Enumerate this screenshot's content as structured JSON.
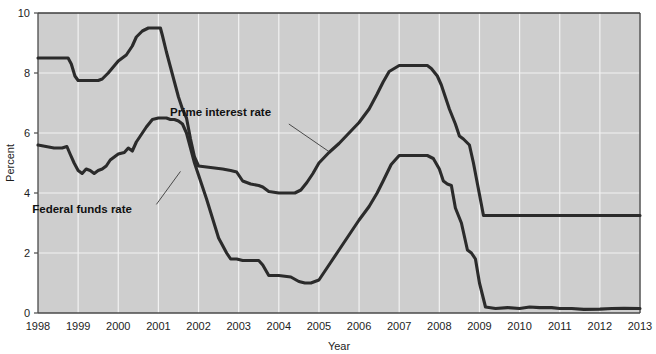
{
  "chart_data": {
    "type": "line",
    "title": "",
    "subtitle": "",
    "xlabel": "Year",
    "ylabel": "Percent",
    "xlim": [
      1998,
      2013
    ],
    "ylim": [
      0,
      10
    ],
    "grid": true,
    "legend_position": "inline-annotations",
    "plot_background": "#cecece",
    "line_color": "#2b2b2b",
    "gridline_color": "#f2f2f2",
    "frame_color": "#3c3c3c",
    "xticks": [
      1998,
      1999,
      2000,
      2001,
      2002,
      2003,
      2004,
      2005,
      2006,
      2007,
      2008,
      2009,
      2010,
      2011,
      2012,
      2013
    ],
    "xtick_labels": [
      "1998",
      "1999",
      "2000",
      "2001",
      "2002",
      "2003",
      "2004",
      "2005",
      "2006",
      "2007",
      "2008",
      "2009",
      "2010",
      "2011",
      "2012",
      "2013"
    ],
    "yticks": [
      0,
      2,
      4,
      6,
      8,
      10
    ],
    "ytick_labels": [
      "0",
      "2",
      "4",
      "6",
      "8",
      "10"
    ],
    "annotations": [
      {
        "name": "prime-interest-rate-annotation",
        "text": "Prime interest rate",
        "text_x": 2002.55,
        "text_y": 6.58,
        "leader_from_x": 2004.25,
        "leader_from_y": 6.3,
        "leader_to_x": 2005.25,
        "leader_to_y": 5.38
      },
      {
        "name": "federal-funds-rate-annotation",
        "text": "Federal funds rate",
        "text_x": 1999.1,
        "text_y": 3.32,
        "leader_from_x": 2000.95,
        "leader_from_y": 3.62,
        "leader_to_x": 2001.55,
        "leader_to_y": 4.72
      }
    ],
    "series": [
      {
        "name": "Prime interest rate",
        "color": "#2b2b2b",
        "x": [
          1998.0,
          1998.75,
          1998.83,
          1998.92,
          1999.0,
          1999.5,
          1999.6,
          1999.75,
          2000.0,
          2000.1,
          2000.2,
          2000.35,
          2000.45,
          2000.6,
          2000.75,
          2001.0,
          2001.05,
          2001.1,
          2001.2,
          2001.3,
          2001.4,
          2001.5,
          2001.6,
          2001.7,
          2001.8,
          2001.9,
          2002.0,
          2002.3,
          2002.6,
          2002.8,
          2002.95,
          2003.1,
          2003.3,
          2003.5,
          2003.6,
          2003.75,
          2004.0,
          2004.4,
          2004.55,
          2004.7,
          2004.85,
          2005.0,
          2005.25,
          2005.5,
          2005.75,
          2006.0,
          2006.25,
          2006.45,
          2006.6,
          2006.75,
          2007.0,
          2007.25,
          2007.5,
          2007.7,
          2007.8,
          2007.95,
          2008.05,
          2008.15,
          2008.25,
          2008.4,
          2008.5,
          2008.6,
          2008.75,
          2008.85,
          2008.95,
          2009.0,
          2009.1,
          2010.0,
          2011.0,
          2012.0,
          2013.0
        ],
        "y": [
          8.5,
          8.5,
          8.3,
          7.9,
          7.75,
          7.75,
          7.8,
          8.0,
          8.4,
          8.5,
          8.6,
          8.9,
          9.2,
          9.4,
          9.5,
          9.5,
          9.5,
          9.25,
          8.7,
          8.2,
          7.7,
          7.2,
          6.8,
          6.5,
          5.8,
          5.2,
          4.9,
          4.85,
          4.8,
          4.75,
          4.7,
          4.4,
          4.3,
          4.25,
          4.2,
          4.05,
          4.0,
          4.0,
          4.1,
          4.35,
          4.65,
          5.0,
          5.35,
          5.65,
          6.0,
          6.35,
          6.8,
          7.3,
          7.7,
          8.05,
          8.25,
          8.25,
          8.25,
          8.25,
          8.15,
          7.9,
          7.6,
          7.2,
          6.8,
          6.3,
          5.9,
          5.8,
          5.6,
          5.0,
          4.3,
          3.95,
          3.25,
          3.25,
          3.25,
          3.25,
          3.25
        ]
      },
      {
        "name": "Federal funds rate",
        "color": "#2b2b2b",
        "x": [
          1998.0,
          1998.2,
          1998.4,
          1998.6,
          1998.72,
          1998.8,
          1998.9,
          1999.0,
          1999.1,
          1999.2,
          1999.3,
          1999.4,
          1999.5,
          1999.6,
          1999.7,
          1999.8,
          1999.9,
          2000.0,
          2000.15,
          2000.25,
          2000.35,
          2000.45,
          2000.55,
          2000.7,
          2000.85,
          2001.0,
          2001.1,
          2001.2,
          2001.3,
          2001.4,
          2001.5,
          2001.6,
          2001.7,
          2001.8,
          2001.9,
          2002.0,
          2002.2,
          2002.5,
          2002.7,
          2002.8,
          2002.95,
          2003.1,
          2003.35,
          2003.5,
          2003.6,
          2003.75,
          2004.0,
          2004.3,
          2004.5,
          2004.65,
          2004.8,
          2005.0,
          2005.25,
          2005.5,
          2005.75,
          2006.0,
          2006.25,
          2006.45,
          2006.6,
          2006.8,
          2007.0,
          2007.3,
          2007.55,
          2007.7,
          2007.85,
          2008.0,
          2008.1,
          2008.2,
          2008.3,
          2008.4,
          2008.55,
          2008.7,
          2008.8,
          2008.9,
          2009.0,
          2009.15,
          2009.4,
          2009.7,
          2010.0,
          2010.25,
          2010.5,
          2010.8,
          2011.0,
          2011.3,
          2011.6,
          2012.0,
          2012.3,
          2012.6,
          2013.0
        ],
        "y": [
          5.6,
          5.55,
          5.5,
          5.5,
          5.55,
          5.3,
          5.0,
          4.75,
          4.65,
          4.8,
          4.75,
          4.65,
          4.75,
          4.8,
          4.9,
          5.1,
          5.2,
          5.3,
          5.35,
          5.5,
          5.4,
          5.7,
          5.9,
          6.2,
          6.45,
          6.5,
          6.5,
          6.5,
          6.45,
          6.45,
          6.4,
          6.3,
          6.0,
          5.5,
          5.0,
          4.6,
          3.8,
          2.5,
          2.0,
          1.8,
          1.8,
          1.75,
          1.75,
          1.75,
          1.6,
          1.25,
          1.25,
          1.2,
          1.05,
          1.0,
          1.0,
          1.1,
          1.6,
          2.1,
          2.6,
          3.1,
          3.55,
          4.0,
          4.4,
          4.95,
          5.25,
          5.25,
          5.25,
          5.25,
          5.15,
          4.8,
          4.4,
          4.3,
          4.25,
          3.5,
          3.0,
          2.1,
          2.0,
          1.8,
          1.0,
          0.2,
          0.15,
          0.18,
          0.15,
          0.2,
          0.18,
          0.18,
          0.15,
          0.15,
          0.12,
          0.13,
          0.15,
          0.16,
          0.15
        ]
      }
    ]
  }
}
